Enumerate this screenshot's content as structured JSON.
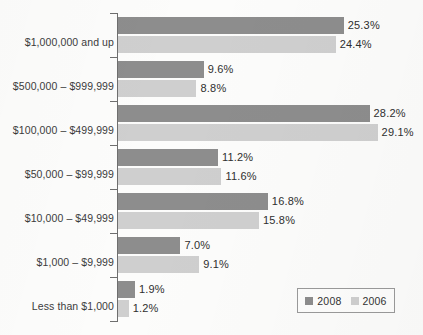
{
  "chart_data": {
    "type": "bar",
    "orientation": "horizontal",
    "title": "",
    "subtitle": "",
    "xlabel": "",
    "ylabel": "",
    "grid": false,
    "xlim": [
      0,
      30
    ],
    "axis_line": true,
    "value_label_suffix": "%",
    "legend_position": "bottom-right",
    "categories": [
      "$1,000,000 and up",
      "$500,000 – $999,999",
      "$100,000 – $499,999",
      "$50,000 – $99,999",
      "$10,000 – $49,999",
      "$1,000 – $9,999",
      "Less than $1,000"
    ],
    "series": [
      {
        "name": "2008",
        "color": "#8d8d8d",
        "values": [
          25.3,
          9.6,
          28.2,
          11.2,
          16.8,
          7.0,
          1.9
        ],
        "labels": [
          "25.3%",
          "9.6%",
          "28.2%",
          "11.2%",
          "16.8%",
          "7.0%",
          "1.9%"
        ]
      },
      {
        "name": "2006",
        "color": "#cfcfcf",
        "values": [
          24.4,
          8.8,
          29.1,
          11.6,
          15.8,
          9.1,
          1.2
        ],
        "labels": [
          "24.4%",
          "8.8%",
          "29.1%",
          "11.6%",
          "15.8%",
          "9.1%",
          "1.2%"
        ]
      }
    ]
  },
  "legend": {
    "entries": [
      {
        "label": "2008",
        "color": "#8d8d8d"
      },
      {
        "label": "2006",
        "color": "#cfcfcf"
      }
    ]
  }
}
